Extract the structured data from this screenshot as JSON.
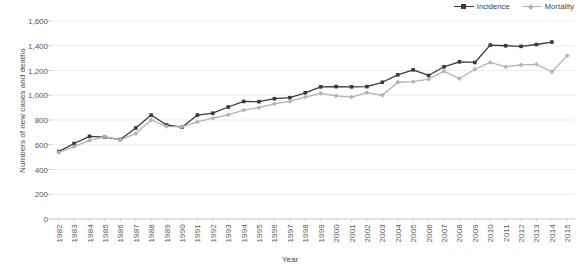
{
  "chart_data": {
    "type": "line",
    "title": "",
    "xlabel": "Year",
    "ylabel": "Numbers of new cases and deaths",
    "ylim": [
      0,
      1600
    ],
    "ytick_step": 200,
    "grid": true,
    "legend_position": "top-right",
    "categories": [
      "1982",
      "1983",
      "1984",
      "1985",
      "1986",
      "1987",
      "1988",
      "1989",
      "1990",
      "1991",
      "1992",
      "1993",
      "1994",
      "1995",
      "1996",
      "1997",
      "1998",
      "1999",
      "2000",
      "2001",
      "2002",
      "2003",
      "2004",
      "2005",
      "2006",
      "2007",
      "2008",
      "2009",
      "2010",
      "2011",
      "2012",
      "2013",
      "2014",
      "2015"
    ],
    "ytick_labels": [
      "0",
      "200",
      "400",
      "600",
      "800",
      "1,000",
      "1,200",
      "1,400",
      "1,600"
    ],
    "series": [
      {
        "name": "Incidence",
        "color": "#3a3a3a",
        "marker": "square",
        "values": [
          545,
          610,
          668,
          662,
          642,
          735,
          840,
          760,
          742,
          840,
          855,
          905,
          950,
          948,
          972,
          980,
          1020,
          1068,
          1070,
          1068,
          1070,
          1105,
          1165,
          1205,
          1160,
          1230,
          1270,
          1265,
          1405,
          1400,
          1395,
          1410,
          1430,
          null
        ]
      },
      {
        "name": "Mortality",
        "color": "#b3b3b3",
        "marker": "diamond",
        "values": [
          538,
          585,
          635,
          665,
          640,
          690,
          800,
          748,
          745,
          785,
          815,
          842,
          880,
          900,
          930,
          950,
          985,
          1015,
          995,
          985,
          1022,
          1000,
          1105,
          1110,
          1130,
          1195,
          1135,
          1210,
          1265,
          1230,
          1245,
          1250,
          1190,
          1320
        ]
      }
    ]
  },
  "legend": {
    "entries": [
      {
        "label": "Incidence"
      },
      {
        "label": "Mortality"
      }
    ]
  }
}
